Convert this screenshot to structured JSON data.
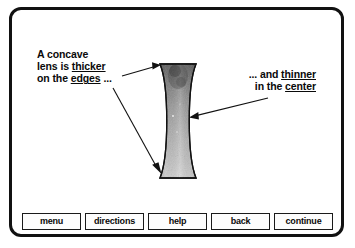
{
  "screen": {
    "title": "Concave Lens Instructional Screen",
    "background_color": "#ffffff",
    "frame_color": "#111111"
  },
  "callouts": {
    "left": {
      "name": "concave-lens-edges-callout",
      "line1": "A concave",
      "line2_prefix": "lens is ",
      "line2_underlined": "thicker",
      "line3_prefix": "on the ",
      "line3_underlined": "edges",
      "line3_suffix": " ..."
    },
    "right": {
      "name": "concave-lens-center-callout",
      "line1_prefix": "... and ",
      "line1_underlined": "thinner",
      "line2_prefix": "in the ",
      "line2_underlined": "center"
    }
  },
  "diagram": {
    "name": "concave-lens-illustration",
    "shape": "biconcave-lens",
    "fill_top_color": "#6f6f6f",
    "fill_bottom_color": "#c9c9c9",
    "outline_color": "#111111",
    "arrows": [
      {
        "name": "arrow-to-lens-top-edge",
        "from": [
          122,
          76
        ],
        "to": [
          160,
          66
        ]
      },
      {
        "name": "arrow-to-lens-bottom-edge",
        "from": [
          113,
          88
        ],
        "to": [
          161,
          171
        ]
      },
      {
        "name": "arrow-to-lens-center",
        "from": [
          268,
          98
        ],
        "to": [
          189,
          117
        ]
      }
    ]
  },
  "nav": {
    "name": "navigation-button-bar",
    "buttons": [
      {
        "label": "menu",
        "name": "menu-button"
      },
      {
        "label": "directions",
        "name": "directions-button"
      },
      {
        "label": "help",
        "name": "help-button"
      },
      {
        "label": "back",
        "name": "back-button"
      },
      {
        "label": "continue",
        "name": "continue-button"
      }
    ]
  }
}
